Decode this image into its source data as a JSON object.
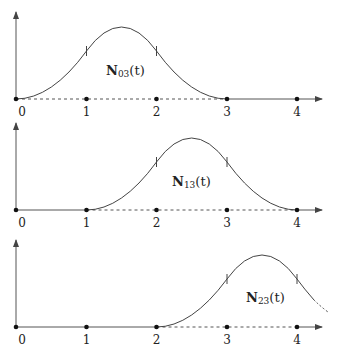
{
  "diagram": {
    "type": "basis-function-plots",
    "x_ticks": [
      "0",
      "1",
      "2",
      "3",
      "4"
    ],
    "panels": [
      {
        "name": "N03",
        "label_main": "N",
        "label_sub": "03",
        "label_arg": "(t)",
        "support": [
          0,
          3
        ]
      },
      {
        "name": "N13",
        "label_main": "N",
        "label_sub": "13",
        "label_arg": "(t)",
        "support": [
          1,
          4
        ]
      },
      {
        "name": "N23",
        "label_main": "N",
        "label_sub": "23",
        "label_arg": "(t)",
        "support": [
          2,
          5
        ]
      }
    ]
  }
}
